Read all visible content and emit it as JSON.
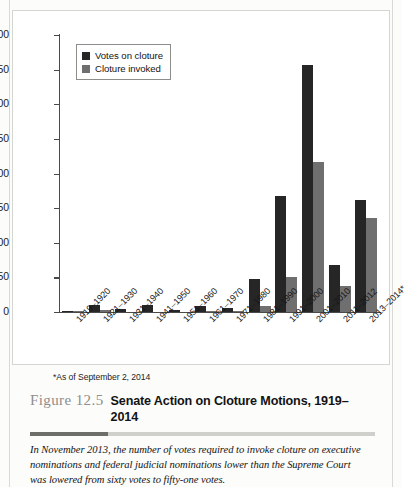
{
  "figure": {
    "number": "Figure 12.5",
    "title": "Senate Action on Cloture Motions, 1919–2014",
    "footnote": "*As of September 2, 2014",
    "caption": "In November 2013, the number of votes required to invoke cloture on executive nominations and federal judicial nominations lower than the Supreme Court was lowered from sixty votes to fifty-one votes."
  },
  "legend": {
    "items": [
      {
        "label": "Votes on cloture",
        "color": "#262626",
        "swatch": "legend-swatch-votes"
      },
      {
        "label": "Cloture invoked",
        "color": "#6f6f6f",
        "swatch": "legend-swatch-invoked"
      }
    ]
  },
  "chart_data": {
    "type": "bar",
    "title": "Senate Action on Cloture Motions, 1919–2014",
    "xlabel": "",
    "ylabel": "",
    "ylim": [
      0,
      400
    ],
    "yticks": [
      0,
      50,
      100,
      150,
      200,
      250,
      300,
      350,
      400
    ],
    "ytick_labels": [
      "0",
      "50",
      "100",
      "150",
      "200",
      "250",
      "300",
      "350",
      "400"
    ],
    "grid": false,
    "legend_position": "upper left inside",
    "categories": [
      "1919–1920",
      "1921–1930",
      "1931–1940",
      "1941–1950",
      "1951–1960",
      "1961–1970",
      "1971–1980",
      "1981–1990",
      "1991–2000",
      "2001–2010",
      "2011–2012",
      "2013–2014*"
    ],
    "series": [
      {
        "name": "Votes on cloture",
        "color": "#262626",
        "values": [
          2,
          10,
          4,
          10,
          3,
          9,
          6,
          48,
          168,
          356,
          68,
          162
        ]
      },
      {
        "name": "Cloture invoked",
        "color": "#6f6f6f",
        "values": [
          1,
          3,
          0,
          0,
          0,
          1,
          1,
          8,
          51,
          217,
          38,
          136
        ]
      }
    ],
    "annotations": [
      "*As of September 2, 2014"
    ]
  }
}
